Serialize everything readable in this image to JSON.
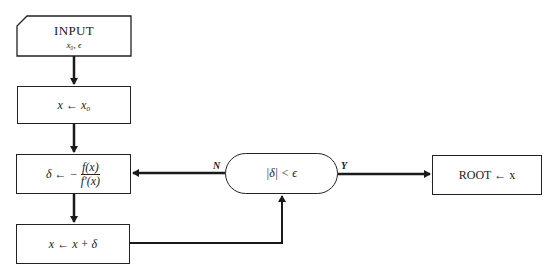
{
  "diagram": {
    "type": "flowchart",
    "nodes": {
      "input": {
        "title": "INPUT",
        "vars": "x₀, ϵ",
        "shape": "card"
      },
      "init": {
        "text": "x ← x₀",
        "shape": "process"
      },
      "delta": {
        "lhs": "δ ← −",
        "num": "f(x)",
        "den": "f′(x)",
        "shape": "process"
      },
      "update": {
        "text": "x ← x + δ",
        "shape": "process"
      },
      "decision": {
        "text": "|δ| < ϵ",
        "shape": "terminal-oval"
      },
      "root": {
        "text": "ROOT ← x",
        "shape": "process"
      }
    },
    "edges": [
      {
        "from": "input",
        "to": "init",
        "label": ""
      },
      {
        "from": "init",
        "to": "delta",
        "label": ""
      },
      {
        "from": "delta",
        "to": "update",
        "label": ""
      },
      {
        "from": "update",
        "to": "decision",
        "label": ""
      },
      {
        "from": "decision",
        "to": "delta",
        "label": "N"
      },
      {
        "from": "decision",
        "to": "root",
        "label": "Y"
      }
    ],
    "labels": {
      "no": "N",
      "yes": "Y"
    }
  }
}
